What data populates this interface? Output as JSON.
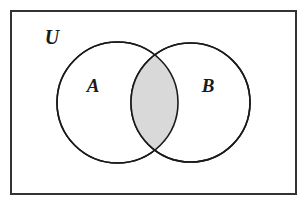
{
  "figure": {
    "kind": "venn-diagram",
    "caption_labels": {
      "universe": "U",
      "set_a": "A",
      "set_b": "B"
    },
    "shaded_region_meaning": "A ∩ B",
    "colors": {
      "background": "#ffffff",
      "stroke": "#1a1a1a",
      "shaded_fill": "#d9d9d9",
      "circle_fill": "#ffffff",
      "border": "#333333"
    },
    "geometry": {
      "canvas_width": 308,
      "canvas_height": 207,
      "rect": {
        "x": 11,
        "y": 11,
        "width": 285,
        "height": 183
      },
      "circle_a": {
        "cx": 117.5,
        "cy": 102.5,
        "r": 60.5
      },
      "circle_b": {
        "cx": 190.5,
        "cy": 102.5,
        "r": 59.5
      },
      "label_positions": {
        "universe": {
          "x": 52,
          "y": 44
        },
        "set_a": {
          "x": 93,
          "y": 92
        },
        "set_b": {
          "x": 208,
          "y": 92
        }
      }
    }
  }
}
